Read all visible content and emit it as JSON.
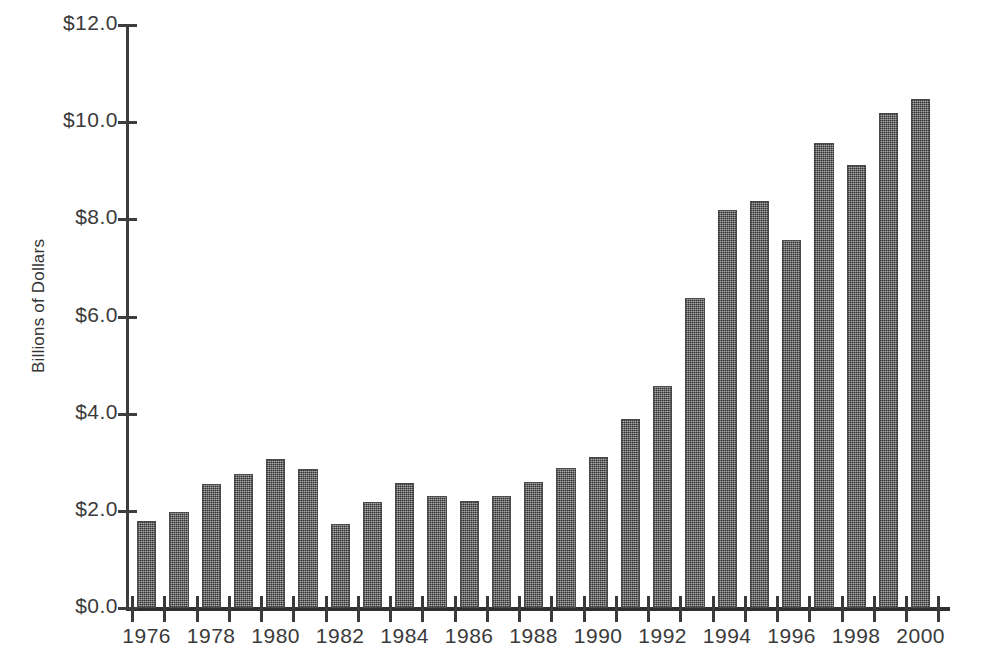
{
  "chart_data": {
    "type": "bar",
    "title": "",
    "xlabel": "",
    "ylabel": "Billions of Dollars",
    "categories": [
      1976,
      1977,
      1978,
      1979,
      1980,
      1981,
      1982,
      1983,
      1984,
      1985,
      1986,
      1987,
      1988,
      1989,
      1990,
      1991,
      1992,
      1993,
      1994,
      1995,
      1996,
      1997,
      1998,
      1999,
      2000
    ],
    "values": [
      1.79,
      1.97,
      2.56,
      2.76,
      3.06,
      2.87,
      1.72,
      2.19,
      2.57,
      2.3,
      2.21,
      2.3,
      2.6,
      2.89,
      3.1,
      3.89,
      4.56,
      6.38,
      8.19,
      8.38,
      7.58,
      9.58,
      9.11,
      10.19,
      10.47
    ],
    "ylim": [
      0.0,
      12.0
    ],
    "y_tick_values": [
      12.0,
      10.0,
      8.0,
      6.0,
      4.0,
      2.0,
      0.0
    ],
    "y_tick_labels": [
      "$12.0",
      "$10.0",
      "$8.0",
      "$6.0",
      "$4.0",
      "$2.0",
      "$0.0"
    ],
    "x_tick_labels": [
      "1976",
      "1978",
      "1980",
      "1982",
      "1984",
      "1986",
      "1988",
      "1990",
      "1992",
      "1994",
      "1996",
      "1998",
      "2000"
    ],
    "grid": false,
    "legend": false,
    "bar_color": "#6e6e6e",
    "bar_edge_color": "#4a4a4a",
    "axis_color": "#3a3a3a",
    "background_color": "#ffffff"
  }
}
